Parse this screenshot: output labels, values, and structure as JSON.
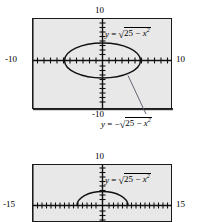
{
  "figures": [
    {
      "id": "top-viewport",
      "window": {
        "top_label": "10",
        "left_label": "-10",
        "right_label": "10",
        "bottom_label": "-10"
      },
      "labels": {
        "upper_equation": "y = √(25 − x²)",
        "lower_equation": "y = −√(25 − x²)"
      },
      "curve": "full-circle"
    },
    {
      "id": "bottom-viewport",
      "window": {
        "top_label": "10",
        "left_label": "-15",
        "right_label": "15"
      },
      "labels": {
        "upper_equation": "y = √(25 − x²)"
      },
      "curve": "upper-semicircle"
    }
  ],
  "equation_parts": {
    "y": "y",
    "equals": "=",
    "minus_sign": "−",
    "radical": "√",
    "twenty_five": "25",
    "minus": "−",
    "x": "x",
    "exponent": "2"
  },
  "colors": {
    "plot_background": "#e8e8e8",
    "frame": "#1a1a1a",
    "curve": "#111111",
    "axis": "#111111",
    "leader_line": "#555566",
    "page_background": "#ffffff"
  }
}
